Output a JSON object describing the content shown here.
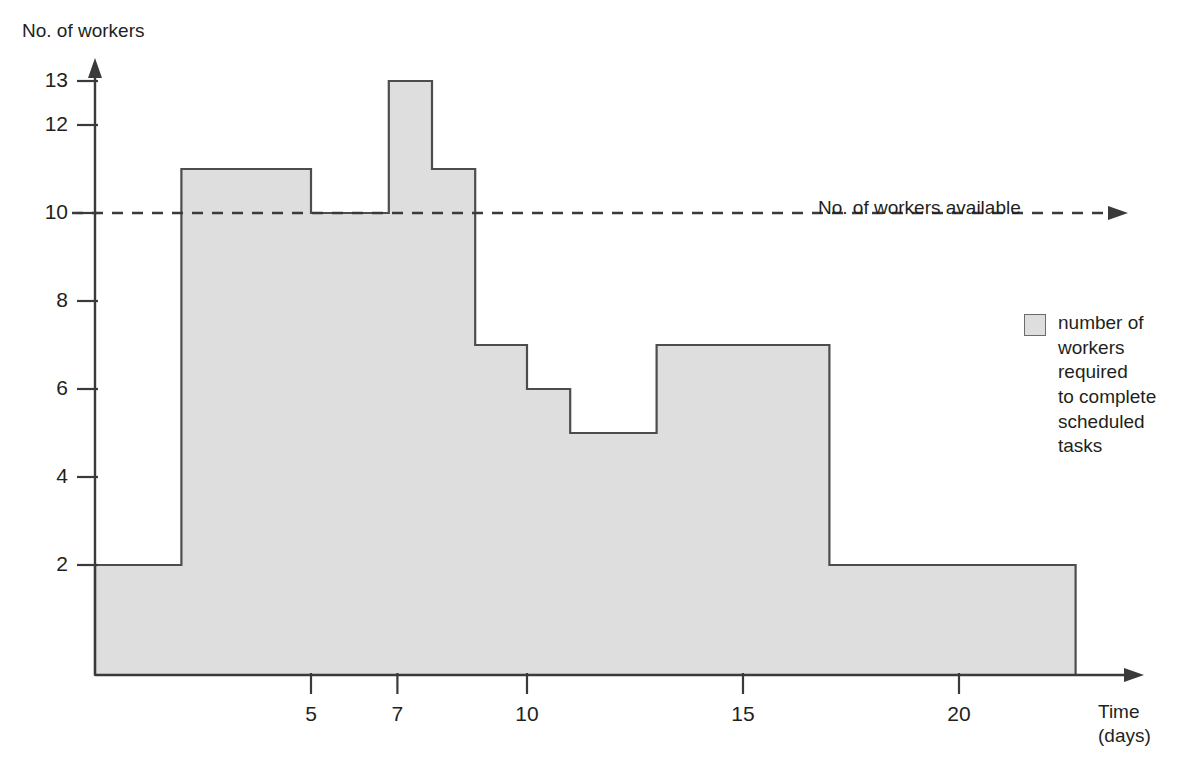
{
  "figure": {
    "y_axis_title": "No. of workers",
    "x_axis_title": "Time\n(days)",
    "available_note": "No. of workers available",
    "legend": {
      "swatch_name": "gray-swatch",
      "label": "number of\nworkers\nrequired\nto complete\nscheduled\ntasks"
    },
    "colors": {
      "bar_fill": "#dedede",
      "bar_stroke": "#4d4d4d",
      "axis": "#3a3a3a",
      "text": "#231f20",
      "dashed_line": "#3a3a3a"
    }
  },
  "chart_data": {
    "type": "bar",
    "title": "",
    "subtitle": "",
    "xlabel": "Time (days)",
    "ylabel": "No. of workers",
    "xlim": [
      0,
      22.7
    ],
    "ylim": [
      0,
      14
    ],
    "grid": false,
    "legend_position": "right",
    "x_ticks": [
      5,
      7,
      10,
      15,
      20
    ],
    "x_tick_labels": [
      "5",
      "7",
      "10",
      "15",
      "20"
    ],
    "y_ticks": [
      2,
      4,
      6,
      8,
      10,
      12,
      13
    ],
    "y_tick_labels": [
      "2",
      "4",
      "6",
      "8",
      "10",
      "12",
      "13"
    ],
    "series": [
      {
        "name": "number of workers required to complete scheduled tasks",
        "type": "step",
        "steps": [
          {
            "start": 0.0,
            "end": 2.0,
            "value": 2
          },
          {
            "start": 2.0,
            "end": 5.0,
            "value": 11
          },
          {
            "start": 5.0,
            "end": 6.8,
            "value": 10
          },
          {
            "start": 6.8,
            "end": 7.8,
            "value": 13
          },
          {
            "start": 7.8,
            "end": 8.8,
            "value": 11
          },
          {
            "start": 8.8,
            "end": 10.0,
            "value": 7
          },
          {
            "start": 10.0,
            "end": 11.0,
            "value": 6
          },
          {
            "start": 11.0,
            "end": 13.0,
            "value": 5
          },
          {
            "start": 13.0,
            "end": 17.0,
            "value": 7
          },
          {
            "start": 17.0,
            "end": 22.7,
            "value": 2
          }
        ]
      }
    ],
    "reference_lines": [
      {
        "name": "No. of workers available",
        "orientation": "horizontal",
        "value": 10,
        "style": "dashed",
        "arrow": true
      }
    ],
    "annotations": [
      {
        "text": "No. of workers available",
        "x": 18.5,
        "y": 11.2
      }
    ]
  },
  "geometry": {
    "origin_x": 95,
    "baseline_y": 675,
    "px_per_day": 43.2,
    "px_per_worker": 44.0,
    "zero_y": 675,
    "plot_right": 1077
  }
}
